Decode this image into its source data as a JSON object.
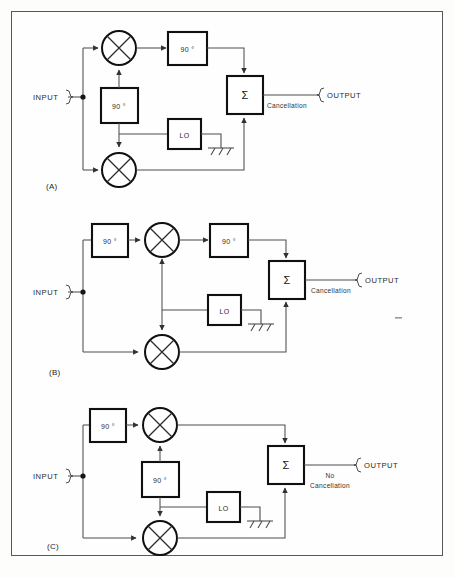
{
  "figure": {
    "type": "block-diagram",
    "background": "#fdfdfc",
    "border_color": "#55585c",
    "ink_color": "#101010",
    "wire_color": "#4a4d50",
    "stray_mark": "-"
  },
  "labels": {
    "input": "INPUT",
    "output": "OUTPUT",
    "phase_shift": "90 °",
    "local_oscillator": "LO",
    "summer": "Σ",
    "cancellation": "Cancellation",
    "no_cancellation_line1": "No",
    "no_cancellation_line2": "Cancellation"
  },
  "panels": [
    {
      "id": "A",
      "id_label": "(A)",
      "result_label": "Cancellation",
      "result_lines": [
        "Cancellation"
      ],
      "input_label": "INPUT",
      "output_label": "OUTPUT",
      "blocks": [
        {
          "name": "phase-shift-rf-output",
          "text": "90 °",
          "path": "upper-arm-output"
        },
        {
          "name": "phase-shift-lo",
          "text": "90 °",
          "path": "lo-to-upper-mixer"
        },
        {
          "name": "local-oscillator",
          "text": "LO",
          "path": "lo-source"
        },
        {
          "name": "summer",
          "text": "Σ",
          "path": "combiner"
        }
      ],
      "mixers": [
        "upper-mixer",
        "lower-mixer"
      ],
      "ground": true
    },
    {
      "id": "B",
      "id_label": "(B)",
      "result_label": "Cancellation",
      "result_lines": [
        "Cancellation"
      ],
      "input_label": "INPUT",
      "output_label": "OUTPUT",
      "blocks": [
        {
          "name": "phase-shift-rf-input",
          "text": "90 °",
          "path": "upper-arm-input"
        },
        {
          "name": "phase-shift-rf-output",
          "text": "90 °",
          "path": "upper-arm-output"
        },
        {
          "name": "local-oscillator",
          "text": "LO",
          "path": "lo-source"
        },
        {
          "name": "summer",
          "text": "Σ",
          "path": "combiner"
        }
      ],
      "mixers": [
        "upper-mixer",
        "lower-mixer"
      ],
      "ground": true
    },
    {
      "id": "C",
      "id_label": "(C)",
      "result_label": "No Cancellation",
      "result_lines": [
        "No",
        "Cancellation"
      ],
      "input_label": "INPUT",
      "output_label": "OUTPUT",
      "blocks": [
        {
          "name": "phase-shift-rf-input",
          "text": "90 °",
          "path": "upper-arm-input"
        },
        {
          "name": "phase-shift-lo",
          "text": "90 °",
          "path": "lo-to-upper-mixer"
        },
        {
          "name": "local-oscillator",
          "text": "LO",
          "path": "lo-source"
        },
        {
          "name": "summer",
          "text": "Σ",
          "path": "combiner"
        }
      ],
      "mixers": [
        "upper-mixer",
        "lower-mixer"
      ],
      "ground": true
    }
  ]
}
